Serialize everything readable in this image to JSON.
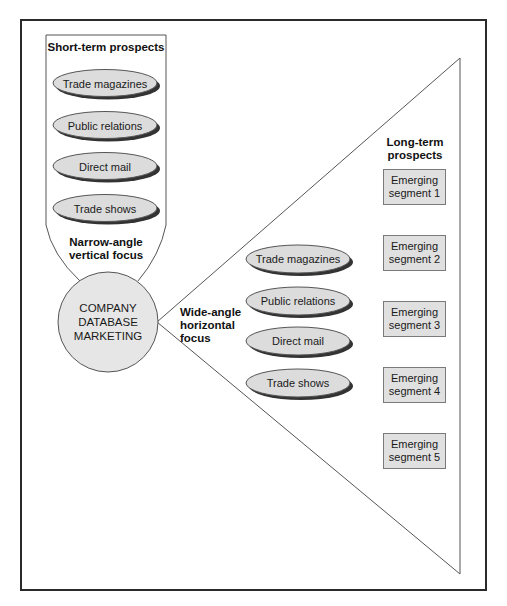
{
  "colors": {
    "frame": "#2a2a2a",
    "ellipse_fill": "#dcdcdc",
    "ellipse_shadow": "#333333",
    "ellipse_stroke": "#555555",
    "circle_fill": "#e6e6e6",
    "segment_fill": "#e0e0e0",
    "segment_border": "#7a7a7a",
    "triangle_stroke": "#555555"
  },
  "short_term": {
    "title": "Short-term prospects",
    "items": [
      {
        "label": "Trade magazines"
      },
      {
        "label": "Public relations"
      },
      {
        "label": "Direct mail"
      },
      {
        "label": "Trade shows"
      }
    ],
    "focus_label_line1": "Narrow-angle",
    "focus_label_line2": "vertical focus"
  },
  "center": {
    "line1": "COMPANY",
    "line2": "DATABASE",
    "line3": "MARKETING"
  },
  "wide_focus": {
    "line1": "Wide-angle",
    "line2": "horizontal",
    "line3": "focus"
  },
  "long_term": {
    "title_line1": "Long-term",
    "title_line2": "prospects",
    "channels": [
      {
        "label": "Trade magazines"
      },
      {
        "label": "Public relations"
      },
      {
        "label": "Direct mail"
      },
      {
        "label": "Trade shows"
      }
    ],
    "segments": [
      {
        "line1": "Emerging",
        "line2": "segment 1"
      },
      {
        "line1": "Emerging",
        "line2": "segment 2"
      },
      {
        "line1": "Emerging",
        "line2": "segment 3"
      },
      {
        "line1": "Emerging",
        "line2": "segment 4"
      },
      {
        "line1": "Emerging",
        "line2": "segment 5"
      }
    ]
  }
}
